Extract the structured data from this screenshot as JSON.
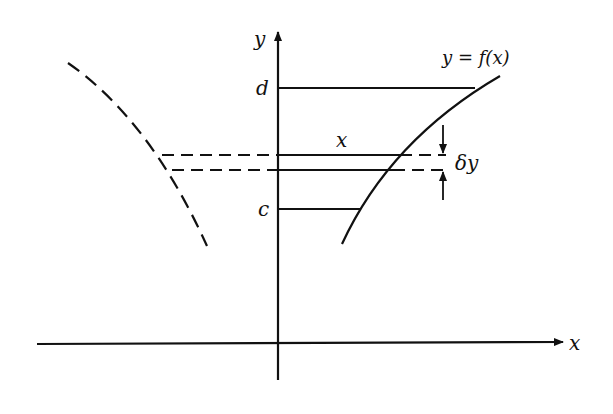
{
  "diagram": {
    "axes": {
      "x_label": "x",
      "y_label": "y"
    },
    "curve_label": "y = f(x)",
    "levels": {
      "upper": "d",
      "lower": "c"
    },
    "strip": {
      "width_label": "x",
      "thickness_label": "δy"
    },
    "colors": {
      "ink": "#111111",
      "background": "#ffffff"
    }
  }
}
